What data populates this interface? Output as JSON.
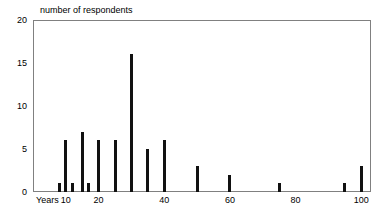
{
  "chart_data": {
    "type": "bar",
    "title": "number of respondents",
    "xlabel": "Years",
    "ylabel": "",
    "categories": [
      8,
      10,
      12,
      15,
      17,
      20,
      25,
      30,
      35,
      40,
      50,
      60,
      75,
      95,
      100
    ],
    "values": [
      1,
      6,
      1,
      7,
      1,
      6,
      6,
      16,
      5,
      6,
      3,
      2,
      1,
      1,
      3
    ],
    "x": [
      8,
      10,
      12,
      15,
      17,
      20,
      25,
      30,
      35,
      40,
      50,
      60,
      75,
      95,
      100
    ],
    "xlim": [
      0,
      103
    ],
    "ylim": [
      0,
      20
    ],
    "y_ticks": [
      0,
      5,
      10,
      15,
      20
    ],
    "y_tick_labels": [
      "0",
      "5",
      "10",
      "15",
      "20"
    ],
    "x_ticks": [
      10,
      20,
      40,
      60,
      80,
      100
    ],
    "x_tick_labels": [
      "10",
      "20",
      "40",
      "60",
      "80",
      "100"
    ],
    "grid": false,
    "legend": null,
    "bar_color": "#111111",
    "frame_color": "#808080",
    "background": "#ffffff"
  },
  "axis": {
    "x_name": "Years"
  }
}
